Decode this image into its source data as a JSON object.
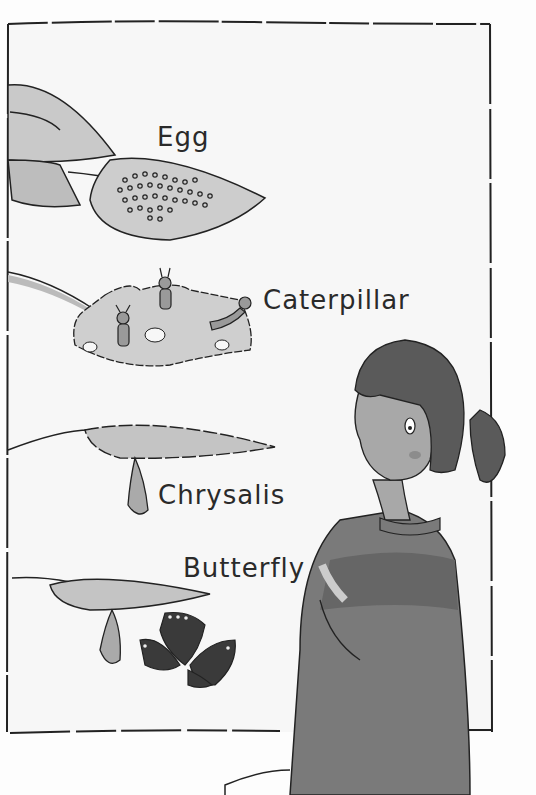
{
  "illustration": {
    "description": "Butterfly life cycle poster with a girl looking at it",
    "stages": [
      {
        "label": "Egg"
      },
      {
        "label": "Caterpillar"
      },
      {
        "label": "Chrysalis"
      },
      {
        "label": "Butterfly"
      }
    ],
    "colors": {
      "background": "#fdfdfd",
      "poster": "#f7f7f7",
      "line": "#222222",
      "leaf": "#c9c9c9",
      "leaf_dark": "#aaaaaa",
      "hair": "#5a5a5a",
      "skin": "#a8a8a8",
      "sweater": "#7a7a7a",
      "sweater_stripe": "#666666",
      "butterfly": "#3a3a3a"
    }
  }
}
